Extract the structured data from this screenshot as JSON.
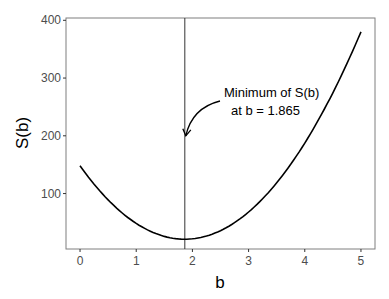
{
  "chart_data": {
    "type": "line",
    "title": "",
    "xlabel": "b",
    "ylabel": "S(b)",
    "xlim": [
      -0.25,
      5.25
    ],
    "ylim": [
      4,
      404
    ],
    "x_ticks": [
      "0",
      "1",
      "2",
      "3",
      "4",
      "5"
    ],
    "y_ticks": [
      "100",
      "200",
      "300",
      "400"
    ],
    "grid": false,
    "legend": null,
    "series": [
      {
        "name": "S(b)",
        "x": [
          0,
          0.5,
          1,
          1.5,
          1.865,
          2,
          2.5,
          3,
          3.5,
          4,
          4.5,
          5
        ],
        "y": [
          148,
          89,
          48,
          26,
          21,
          22,
          36,
          68,
          118,
          187,
          275,
          380
        ]
      }
    ],
    "vline": {
      "x": 1.865
    },
    "annotation": {
      "line1": "Minimum of S(b)",
      "line2": "at b = 1.865",
      "arrow_to": {
        "x": 1.865,
        "y": 200
      }
    }
  }
}
